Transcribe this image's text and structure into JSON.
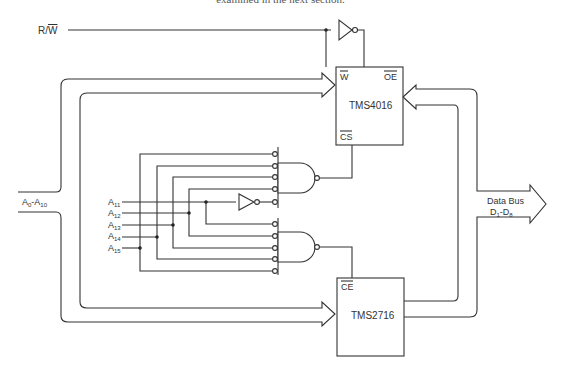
{
  "caption": "examined in the next section.",
  "signals": {
    "rw": "R/W",
    "address_bus": "A0-A10",
    "data_bus_line1": "Data Bus",
    "data_bus_line2": "D1-D8"
  },
  "address_inputs": [
    "A11",
    "A12",
    "A13",
    "A14",
    "A15"
  ],
  "chips": {
    "ram": {
      "name": "TMS4016",
      "pins": {
        "w": "W",
        "oe": "OE",
        "cs": "CS"
      }
    },
    "rom": {
      "name": "TMS2716",
      "pins": {
        "ce": "CE"
      }
    }
  }
}
